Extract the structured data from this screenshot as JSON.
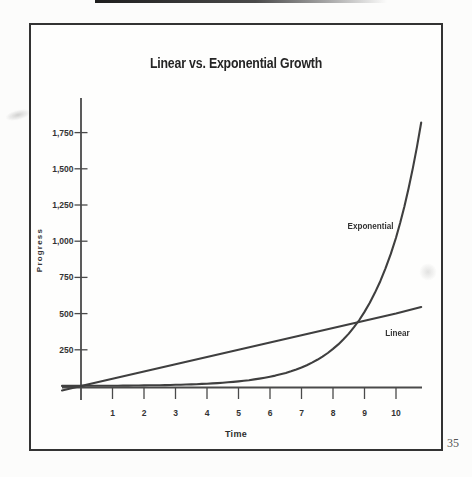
{
  "page": {
    "page_number": "35"
  },
  "chart_data": {
    "type": "line",
    "title": "Linear vs. Exponential Growth",
    "xlabel": "Time",
    "ylabel": "Progress",
    "xlim": [
      0,
      10.8
    ],
    "ylim": [
      0,
      1980
    ],
    "x_ticks": [
      1,
      2,
      3,
      4,
      5,
      6,
      7,
      8,
      9,
      10
    ],
    "y_ticks": [
      250,
      500,
      750,
      1000,
      1250,
      1500,
      1750
    ],
    "y_tick_labels": [
      "250",
      "500",
      "750",
      "1,000",
      "1,250",
      "1,500",
      "1,750"
    ],
    "grid": false,
    "legend": "inline-labels",
    "line_color": "#3f3f3f",
    "axis_color": "#4a4a4a",
    "series": [
      {
        "name": "Linear",
        "label": "Linear",
        "interpolation": "linear",
        "x": [
          0,
          1,
          2,
          3,
          4,
          5,
          6,
          7,
          8,
          9,
          10,
          10.8
        ],
        "y": [
          0,
          50,
          100,
          150,
          200,
          250,
          300,
          350,
          400,
          450,
          500,
          545
        ]
      },
      {
        "name": "Exponential",
        "label": "Exponential",
        "interpolation": "log",
        "x": [
          0,
          1,
          2,
          3,
          4,
          5,
          6,
          7,
          8,
          9,
          10,
          10.8
        ],
        "y": [
          1,
          2,
          4,
          8,
          16,
          32,
          64,
          128,
          256,
          512,
          1024,
          1820
        ]
      }
    ]
  }
}
